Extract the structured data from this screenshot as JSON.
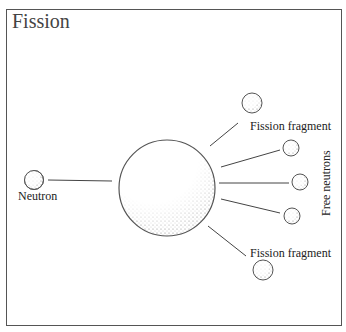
{
  "title": "Fission",
  "labels": {
    "neutron": "Neutron",
    "fragment_top": "Fission fragment",
    "fragment_bottom": "Fission fragment",
    "free_neutrons": "Free neutrons"
  },
  "colors": {
    "stroke": "#555555",
    "stipple": "#888888",
    "text": "#222222"
  }
}
